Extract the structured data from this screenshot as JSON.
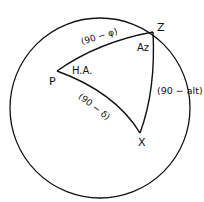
{
  "diagram": {
    "vertices": {
      "P": "P",
      "Z": "Z",
      "X": "X"
    },
    "angles": {
      "hour_angle": "H.A.",
      "azimuth": "Az"
    },
    "sides": {
      "PZ": "(90 − φ)",
      "PX": "(90 − δ)",
      "ZX": "(90 − alt)"
    },
    "colors": {
      "stroke": "#111111",
      "background": "#ffffff"
    }
  }
}
